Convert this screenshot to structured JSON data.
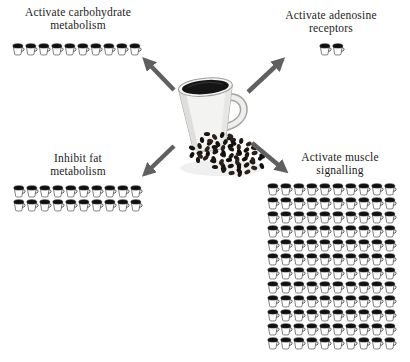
{
  "diagram": {
    "background_color": "#ffffff",
    "text_color": "#1c1c1c",
    "arrow_color": "#606060",
    "center_image": "white mug of black coffee with a pile of coffee beans spilling to the right",
    "groups": [
      {
        "id": "carbohydrate-metabolism",
        "position": "top-left",
        "label_lines": [
          "Activate carbohydrate",
          "metabolism"
        ],
        "cup_count": 10,
        "columns": 10,
        "rows": 1
      },
      {
        "id": "adenosine-receptors",
        "position": "top-right",
        "label_lines": [
          "Activate adenosine",
          "receptors"
        ],
        "cup_count": 2,
        "columns": 2,
        "rows": 1
      },
      {
        "id": "fat-metabolism",
        "position": "bottom-left",
        "label_lines": [
          "Inhibit fat",
          "metabolism"
        ],
        "cup_count": 20,
        "columns": 10,
        "rows": 2
      },
      {
        "id": "muscle-signalling",
        "position": "bottom-right",
        "label_lines": [
          "Activate muscle",
          "signalling"
        ],
        "cup_count": 120,
        "columns": 10,
        "rows": 12
      }
    ],
    "arrow_directions": [
      "up-left",
      "up-right",
      "down-left",
      "down-right"
    ]
  }
}
